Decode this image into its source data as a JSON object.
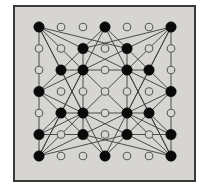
{
  "figure": {
    "background_color": "#ffffff",
    "panel_color": "#d6d5d2",
    "frame_color": "#3a3a3a",
    "node_fill_color": "#0a0a0a",
    "node_open_fill": "#d6d5d2",
    "node_stroke_color": "#5a5a5a",
    "edge_color": "#3c3c3c"
  },
  "chart_data": {
    "type": "scatter",
    "title": "",
    "xlabel": "",
    "ylabel": "",
    "grid": false,
    "xlim": [
      0,
      6
    ],
    "ylim": [
      0,
      6
    ],
    "legend_position": "none",
    "layout": {
      "origin_x": 39,
      "origin_y": 27,
      "step_x": 22,
      "step_y": 21.5,
      "columns": 7,
      "rows": 7
    },
    "node_radius_filled": 5.2,
    "node_radius_open": 3.8,
    "series": [
      {
        "name": "filled vertices",
        "marker": "filled-circle",
        "points": [
          [
            0,
            0
          ],
          [
            3,
            0
          ],
          [
            6,
            0
          ],
          [
            2,
            1
          ],
          [
            4,
            1
          ],
          [
            1,
            2
          ],
          [
            2,
            2
          ],
          [
            4,
            2
          ],
          [
            5,
            2
          ],
          [
            0,
            3
          ],
          [
            6,
            3
          ],
          [
            1,
            4
          ],
          [
            2,
            4
          ],
          [
            4,
            4
          ],
          [
            5,
            4
          ],
          [
            0,
            5
          ],
          [
            2,
            5
          ],
          [
            4,
            5
          ],
          [
            6,
            5
          ],
          [
            0,
            6
          ],
          [
            3,
            6
          ],
          [
            6,
            6
          ]
        ]
      },
      {
        "name": "open vertices",
        "marker": "open-circle",
        "points": [
          [
            1,
            0
          ],
          [
            2,
            0
          ],
          [
            4,
            0
          ],
          [
            5,
            0
          ],
          [
            0,
            1
          ],
          [
            1,
            1
          ],
          [
            3,
            1
          ],
          [
            5,
            1
          ],
          [
            6,
            1
          ],
          [
            0,
            2
          ],
          [
            3,
            2
          ],
          [
            6,
            2
          ],
          [
            1,
            3
          ],
          [
            2,
            3
          ],
          [
            3,
            3
          ],
          [
            4,
            3
          ],
          [
            5,
            3
          ],
          [
            0,
            4
          ],
          [
            3,
            4
          ],
          [
            6,
            4
          ],
          [
            1,
            5
          ],
          [
            3,
            5
          ],
          [
            5,
            5
          ],
          [
            1,
            6
          ],
          [
            2,
            6
          ],
          [
            4,
            6
          ],
          [
            5,
            6
          ]
        ]
      }
    ],
    "edges": [
      [
        [
          0,
          0
        ],
        [
          0,
          3
        ]
      ],
      [
        [
          0,
          3
        ],
        [
          0,
          5
        ]
      ],
      [
        [
          0,
          5
        ],
        [
          0,
          6
        ]
      ],
      [
        [
          6,
          0
        ],
        [
          6,
          3
        ]
      ],
      [
        [
          6,
          3
        ],
        [
          6,
          5
        ]
      ],
      [
        [
          6,
          5
        ],
        [
          6,
          6
        ]
      ],
      [
        [
          1,
          2
        ],
        [
          2,
          2
        ]
      ],
      [
        [
          2,
          2
        ],
        [
          4,
          2
        ]
      ],
      [
        [
          4,
          2
        ],
        [
          5,
          2
        ]
      ],
      [
        [
          1,
          4
        ],
        [
          2,
          4
        ]
      ],
      [
        [
          2,
          4
        ],
        [
          4,
          4
        ]
      ],
      [
        [
          4,
          4
        ],
        [
          5,
          4
        ]
      ],
      [
        [
          2,
          1
        ],
        [
          2,
          2
        ]
      ],
      [
        [
          2,
          2
        ],
        [
          2,
          4
        ]
      ],
      [
        [
          2,
          4
        ],
        [
          2,
          5
        ]
      ],
      [
        [
          4,
          1
        ],
        [
          4,
          2
        ]
      ],
      [
        [
          4,
          2
        ],
        [
          4,
          4
        ]
      ],
      [
        [
          4,
          4
        ],
        [
          4,
          5
        ]
      ],
      [
        [
          0,
          0
        ],
        [
          2,
          1
        ]
      ],
      [
        [
          0,
          0
        ],
        [
          1,
          2
        ]
      ],
      [
        [
          0,
          0
        ],
        [
          2,
          2
        ]
      ],
      [
        [
          0,
          0
        ],
        [
          4,
          1
        ]
      ],
      [
        [
          0,
          0
        ],
        [
          2,
          4
        ]
      ],
      [
        [
          6,
          0
        ],
        [
          4,
          1
        ]
      ],
      [
        [
          6,
          0
        ],
        [
          5,
          2
        ]
      ],
      [
        [
          6,
          0
        ],
        [
          4,
          2
        ]
      ],
      [
        [
          6,
          0
        ],
        [
          2,
          1
        ]
      ],
      [
        [
          6,
          0
        ],
        [
          4,
          4
        ]
      ],
      [
        [
          0,
          6
        ],
        [
          2,
          5
        ]
      ],
      [
        [
          0,
          6
        ],
        [
          1,
          4
        ]
      ],
      [
        [
          0,
          6
        ],
        [
          2,
          4
        ]
      ],
      [
        [
          0,
          6
        ],
        [
          4,
          5
        ]
      ],
      [
        [
          0,
          6
        ],
        [
          2,
          2
        ]
      ],
      [
        [
          6,
          6
        ],
        [
          4,
          5
        ]
      ],
      [
        [
          6,
          6
        ],
        [
          5,
          4
        ]
      ],
      [
        [
          6,
          6
        ],
        [
          4,
          4
        ]
      ],
      [
        [
          6,
          6
        ],
        [
          2,
          5
        ]
      ],
      [
        [
          6,
          6
        ],
        [
          4,
          2
        ]
      ],
      [
        [
          3,
          0
        ],
        [
          2,
          1
        ]
      ],
      [
        [
          3,
          0
        ],
        [
          4,
          1
        ]
      ],
      [
        [
          3,
          0
        ],
        [
          2,
          2
        ]
      ],
      [
        [
          3,
          0
        ],
        [
          4,
          2
        ]
      ],
      [
        [
          3,
          6
        ],
        [
          2,
          5
        ]
      ],
      [
        [
          3,
          6
        ],
        [
          4,
          5
        ]
      ],
      [
        [
          3,
          6
        ],
        [
          2,
          4
        ]
      ],
      [
        [
          3,
          6
        ],
        [
          4,
          4
        ]
      ],
      [
        [
          0,
          3
        ],
        [
          1,
          2
        ]
      ],
      [
        [
          0,
          3
        ],
        [
          1,
          4
        ]
      ],
      [
        [
          0,
          3
        ],
        [
          2,
          2
        ]
      ],
      [
        [
          0,
          3
        ],
        [
          2,
          4
        ]
      ],
      [
        [
          6,
          3
        ],
        [
          5,
          2
        ]
      ],
      [
        [
          6,
          3
        ],
        [
          5,
          4
        ]
      ],
      [
        [
          6,
          3
        ],
        [
          4,
          2
        ]
      ],
      [
        [
          6,
          3
        ],
        [
          4,
          4
        ]
      ],
      [
        [
          2,
          2
        ],
        [
          4,
          4
        ]
      ],
      [
        [
          4,
          2
        ],
        [
          2,
          4
        ]
      ],
      [
        [
          2,
          1
        ],
        [
          4,
          2
        ]
      ],
      [
        [
          4,
          1
        ],
        [
          2,
          2
        ]
      ],
      [
        [
          2,
          5
        ],
        [
          4,
          4
        ]
      ],
      [
        [
          4,
          5
        ],
        [
          2,
          4
        ]
      ],
      [
        [
          1,
          2
        ],
        [
          2,
          4
        ]
      ],
      [
        [
          1,
          4
        ],
        [
          2,
          2
        ]
      ],
      [
        [
          5,
          2
        ],
        [
          4,
          4
        ]
      ],
      [
        [
          5,
          4
        ],
        [
          4,
          2
        ]
      ],
      [
        [
          2,
          1
        ],
        [
          1,
          2
        ]
      ],
      [
        [
          4,
          1
        ],
        [
          5,
          2
        ]
      ],
      [
        [
          2,
          5
        ],
        [
          1,
          4
        ]
      ],
      [
        [
          4,
          5
        ],
        [
          5,
          4
        ]
      ],
      [
        [
          0,
          5
        ],
        [
          2,
          5
        ]
      ],
      [
        [
          0,
          5
        ],
        [
          1,
          4
        ]
      ],
      [
        [
          0,
          5
        ],
        [
          2,
          4
        ]
      ],
      [
        [
          6,
          5
        ],
        [
          4,
          5
        ]
      ],
      [
        [
          6,
          5
        ],
        [
          5,
          4
        ]
      ],
      [
        [
          6,
          5
        ],
        [
          4,
          4
        ]
      ],
      [
        [
          0,
          5
        ],
        [
          0,
          6
        ]
      ],
      [
        [
          6,
          5
        ],
        [
          6,
          6
        ]
      ],
      [
        [
          2,
          2
        ],
        [
          4,
          1
        ]
      ],
      [
        [
          4,
          2
        ],
        [
          2,
          1
        ]
      ],
      [
        [
          2,
          4
        ],
        [
          4,
          5
        ]
      ],
      [
        [
          4,
          4
        ],
        [
          2,
          5
        ]
      ]
    ]
  }
}
